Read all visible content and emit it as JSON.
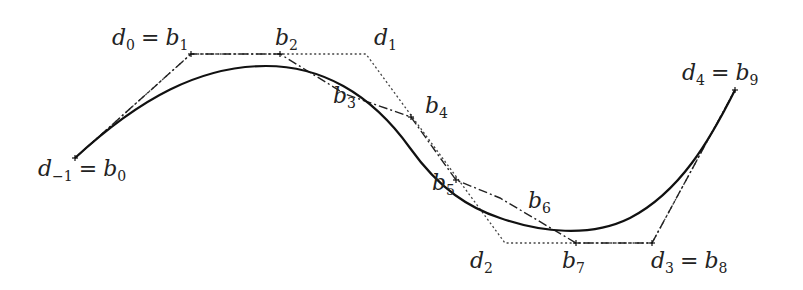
{
  "figure": {
    "colors": {
      "curve": "#1a1a1a",
      "polygon": "#333333",
      "background": "#ffffff"
    },
    "deboor_points": [
      {
        "id": "d-1",
        "x": 75,
        "y": 158
      },
      {
        "id": "d0",
        "x": 191,
        "y": 54
      },
      {
        "id": "d1",
        "x": 366,
        "y": 54
      },
      {
        "id": "d2",
        "x": 505,
        "y": 243
      },
      {
        "id": "d3",
        "x": 652,
        "y": 243
      },
      {
        "id": "d4",
        "x": 735,
        "y": 90
      }
    ],
    "bezier_points": [
      {
        "id": "b0",
        "x": 75,
        "y": 158
      },
      {
        "id": "b1",
        "x": 191,
        "y": 54
      },
      {
        "id": "b2",
        "x": 280,
        "y": 54
      },
      {
        "id": "b3",
        "x": 345,
        "y": 94
      },
      {
        "id": "b4",
        "x": 411,
        "y": 117
      },
      {
        "id": "b5",
        "x": 456,
        "y": 180
      },
      {
        "id": "b6",
        "x": 500,
        "y": 198
      },
      {
        "id": "b7",
        "x": 576,
        "y": 243
      },
      {
        "id": "b8",
        "x": 652,
        "y": 243
      },
      {
        "id": "b9",
        "x": 735,
        "y": 90
      }
    ],
    "labels": [
      {
        "name": "label-d-1-b0",
        "var1": "d",
        "sub1": "−1",
        "var2": "b",
        "sub2": "0",
        "x": 38,
        "y": 158
      },
      {
        "name": "label-d0-b1",
        "var1": "d",
        "sub1": "0",
        "var2": "b",
        "sub2": "1",
        "x": 112,
        "y": 27
      },
      {
        "name": "label-b2",
        "var1": "b",
        "sub1": "2",
        "x": 275,
        "y": 27
      },
      {
        "name": "label-d1",
        "var1": "d",
        "sub1": "1",
        "x": 374,
        "y": 27
      },
      {
        "name": "label-b3",
        "var1": "b",
        "sub1": "3",
        "x": 333,
        "y": 85
      },
      {
        "name": "label-b4",
        "var1": "b",
        "sub1": "4",
        "x": 425,
        "y": 95
      },
      {
        "name": "label-b5",
        "var1": "b",
        "sub1": "5",
        "x": 432,
        "y": 172
      },
      {
        "name": "label-b6",
        "var1": "b",
        "sub1": "6",
        "x": 528,
        "y": 190
      },
      {
        "name": "label-d2",
        "var1": "d",
        "sub1": "2",
        "x": 470,
        "y": 250
      },
      {
        "name": "label-b7",
        "var1": "b",
        "sub1": "7",
        "x": 562,
        "y": 250
      },
      {
        "name": "label-d3-b8",
        "var1": "d",
        "sub1": "3",
        "var2": "b",
        "sub2": "8",
        "x": 651,
        "y": 250
      },
      {
        "name": "label-d4-b9",
        "var1": "d",
        "sub1": "4",
        "var2": "b",
        "sub2": "9",
        "x": 682,
        "y": 62
      }
    ]
  }
}
